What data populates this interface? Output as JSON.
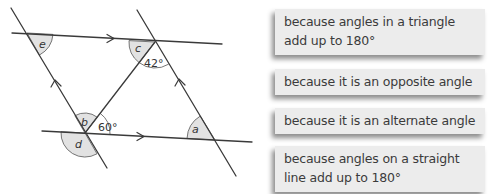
{
  "diagram": {
    "angle_labels": {
      "a": "a",
      "b": "b",
      "c": "c",
      "d": "d",
      "e": "e"
    },
    "given_angles": {
      "top": "42°",
      "bottom": "60°"
    },
    "colors": {
      "line": "#3a3a3a",
      "shade": "#e2e2e2"
    }
  },
  "reasons": [
    {
      "text_line1": "because angles in a triangle",
      "text_line2": "add up to 180°"
    },
    {
      "text_line1": "because it is an opposite angle"
    },
    {
      "text_line1": "because it is an alternate angle"
    },
    {
      "text_line1": "because angles on a straight",
      "text_line2": "line add up to 180°"
    }
  ],
  "colors": {
    "box_background": "#ececec",
    "box_text": "#3b3b3b"
  }
}
